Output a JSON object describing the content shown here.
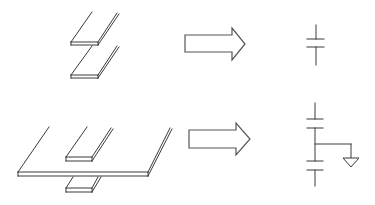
{
  "diagram": {
    "title": "",
    "rows": [
      {
        "id": "two-plate",
        "physical": {
          "description": "Two parallel stacked conductor plates",
          "plates": 2
        },
        "arrow": {
          "direction": "right"
        },
        "schematic": {
          "symbol": "capacitor",
          "capacitors": 1,
          "ground": false
        }
      },
      {
        "id": "three-plate",
        "physical": {
          "description": "Small plate above, large wide plate in middle, small plate below",
          "plates": 3
        },
        "arrow": {
          "direction": "right"
        },
        "schematic": {
          "symbol": "two-series-capacitors-with-ground",
          "capacitors": 2,
          "ground": true
        }
      }
    ],
    "colors": {
      "line": "#3a3a3a",
      "arrow_outline": "#555555",
      "background": "#ffffff"
    }
  }
}
